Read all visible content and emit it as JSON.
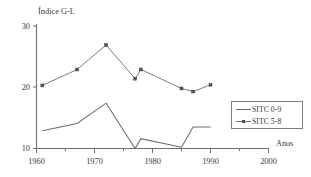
{
  "chart_data": {
    "type": "line",
    "title": "",
    "ylabel": "Índice G-L",
    "xlabel": "Anos",
    "xlim": [
      1960,
      2000
    ],
    "ylim": [
      10,
      30
    ],
    "yticks": [
      10,
      20,
      30
    ],
    "xticks": [
      1960,
      1970,
      1980,
      1990,
      2000
    ],
    "xminorticks": [
      1965,
      1975,
      1985,
      1995
    ],
    "grid": false,
    "legend_position": "right",
    "series": [
      {
        "name": "SITC 0-9",
        "markers": false,
        "points": [
          {
            "x": 1961,
            "y": 12.9
          },
          {
            "x": 1967,
            "y": 14.1
          },
          {
            "x": 1972,
            "y": 17.4
          },
          {
            "x": 1977,
            "y": 10.0
          },
          {
            "x": 1978,
            "y": 11.6
          },
          {
            "x": 1985,
            "y": 10.2
          },
          {
            "x": 1987,
            "y": 13.5
          },
          {
            "x": 1990,
            "y": 13.5
          }
        ]
      },
      {
        "name": "SITC 5-8",
        "markers": true,
        "points": [
          {
            "x": 1961,
            "y": 20.3
          },
          {
            "x": 1967,
            "y": 22.9
          },
          {
            "x": 1972,
            "y": 26.9
          },
          {
            "x": 1977,
            "y": 21.4
          },
          {
            "x": 1978,
            "y": 22.9
          },
          {
            "x": 1985,
            "y": 19.8
          },
          {
            "x": 1987,
            "y": 19.3
          },
          {
            "x": 1990,
            "y": 20.4
          }
        ]
      }
    ]
  },
  "legend": {
    "items": [
      {
        "label": "SITC 0-9",
        "marker": false
      },
      {
        "label": "SITC 5-8",
        "marker": true
      }
    ]
  },
  "axis_labels": {
    "y_axis_title": "Índice G-L",
    "x_axis_title": "Anos",
    "y_ticks": [
      "30",
      "20",
      "10"
    ],
    "x_ticks": [
      "1960",
      "1970",
      "1980",
      "1990",
      "2000"
    ]
  },
  "colors": {
    "axis": "#6e6e73",
    "series_0_9": "#6b6b70",
    "series_5_8": "#7a7a80",
    "text": "#3b3b3b",
    "background": "#ffffff"
  }
}
